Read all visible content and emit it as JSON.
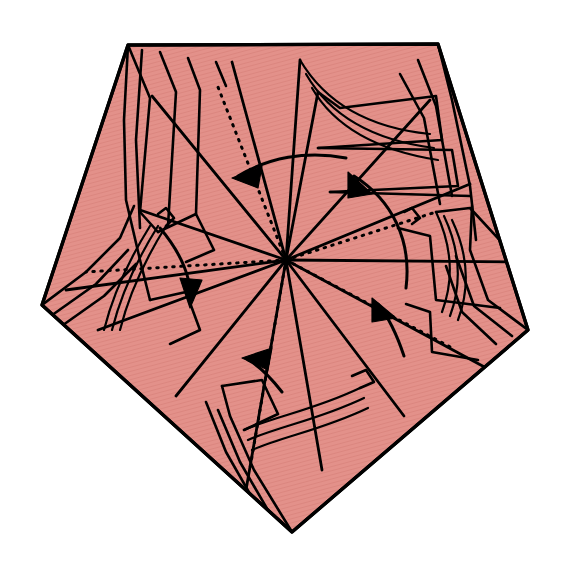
{
  "figure": {
    "canvas": {
      "width": 568,
      "height": 577
    },
    "background_color": "#ffffff"
  },
  "paper": {
    "name": "pentagon-sheet",
    "fill_color": "#E3918A",
    "hatch_color": "#D9837C",
    "stroke_color": "#000000",
    "outline_points": "128,45 438,44 528,330 292,532 42,305",
    "vertices": [
      {
        "label": "top-left",
        "x": 128,
        "y": 45
      },
      {
        "label": "top-right",
        "x": 438,
        "y": 44
      },
      {
        "label": "right",
        "x": 528,
        "y": 330
      },
      {
        "label": "bottom",
        "x": 292,
        "y": 532
      },
      {
        "label": "left",
        "x": 42,
        "y": 305
      }
    ]
  },
  "center": {
    "name": "twist-center",
    "x": 286,
    "y": 260
  },
  "dotted_folds": [
    {
      "name": "dotted-fold-top-left",
      "path": "M286,260 L216,82"
    },
    {
      "name": "dotted-fold-top-right",
      "path": "M286,260 L436,212"
    },
    {
      "name": "dotted-fold-right",
      "path": "M286,260 L452,348"
    },
    {
      "name": "dotted-fold-bottom",
      "path": "M286,260 L250,468"
    },
    {
      "name": "dotted-fold-left",
      "path": "M286,260 L86,272"
    }
  ],
  "radial_creases": [
    {
      "name": "crease-r1",
      "path": "M286,260 L140,210"
    },
    {
      "name": "crease-r2",
      "path": "M286,260 L152,96"
    },
    {
      "name": "crease-r3",
      "path": "M286,260 L232,62"
    },
    {
      "name": "crease-r4",
      "path": "M286,260 L300,60"
    },
    {
      "name": "crease-r5",
      "path": "M286,260 L318,92"
    },
    {
      "name": "crease-r6",
      "path": "M286,260 L430,100"
    },
    {
      "name": "crease-r7",
      "path": "M286,260 L470,184"
    },
    {
      "name": "crease-r8",
      "path": "M286,260 L520,262"
    },
    {
      "name": "crease-r9",
      "path": "M286,260 L490,370"
    },
    {
      "name": "crease-r10",
      "path": "M286,260 L404,416"
    },
    {
      "name": "crease-r11",
      "path": "M286,260 L322,470"
    },
    {
      "name": "crease-r12",
      "path": "M286,260 L246,490"
    },
    {
      "name": "crease-r13",
      "path": "M286,260 L176,396"
    },
    {
      "name": "crease-r14",
      "path": "M286,260 L98,330"
    },
    {
      "name": "crease-r15",
      "path": "M286,260 L66,290"
    }
  ],
  "pleats": [
    {
      "name": "pleat-tl-1",
      "path": "M128,45 L150,98 L140,212 L158,232"
    },
    {
      "name": "pleat-tl-2",
      "path": "M160,52 L176,92 L168,226"
    },
    {
      "name": "pleat-tl-3",
      "path": "M188,58 L200,90 L196,214"
    },
    {
      "name": "pleat-tl-4",
      "path": "M216,62 L226,86"
    },
    {
      "name": "pleat-tl-5",
      "path": "M128,45 L124,120 L126,200 L140,260 L150,300"
    },
    {
      "name": "pleat-tl-6",
      "path": "M142,50 L136,140 L140,228"
    },
    {
      "name": "pleat-top-ridge",
      "path": "M128,45 L438,44"
    },
    {
      "name": "pleat-tr-1",
      "path": "M438,44 L452,100 L470,186 L476,240"
    },
    {
      "name": "pleat-tr-2",
      "path": "M418,60 L436,106 L452,196"
    },
    {
      "name": "pleat-tr-3",
      "path": "M400,74 L424,118 L440,204"
    },
    {
      "name": "pleat-r-1",
      "path": "M528,330 L488,300 L470,250 L472,206"
    },
    {
      "name": "pleat-r-2",
      "path": "M512,336 L474,306 L456,256"
    },
    {
      "name": "pleat-r-3",
      "path": "M496,344 L462,312 L446,266"
    },
    {
      "name": "pleat-l-1",
      "path": "M42,305 L86,272 L120,238 L134,206"
    },
    {
      "name": "pleat-l-2",
      "path": "M48,318 L96,284 L128,250"
    },
    {
      "name": "pleat-l-3",
      "path": "M56,330 L104,296 L136,264"
    },
    {
      "name": "pleat-b-1",
      "path": "M292,532 L254,470 L230,416 L222,386"
    },
    {
      "name": "pleat-b-2",
      "path": "M276,524 L240,462 L218,410"
    },
    {
      "name": "pleat-b-3",
      "path": "M258,508 L226,452 L206,402"
    }
  ],
  "panel_edges": [
    {
      "name": "panel-edge-upper-right-a",
      "path": "M318,92 L340,108 L436,96 L442,140 L318,148"
    },
    {
      "name": "panel-edge-upper-right-b",
      "path": "M318,148 L452,150 L458,186 L330,192"
    },
    {
      "name": "panel-edge-upper-right-c",
      "path": "M330,192 L470,196"
    },
    {
      "name": "panel-edge-mid-right",
      "path": "M436,212 L470,208 L520,262"
    },
    {
      "name": "panel-edge-right-step",
      "path": "M404,212 L412,208 L420,218 L412,224"
    },
    {
      "name": "panel-edge-lower-right-a",
      "path": "M398,228 L430,236 L436,300 L500,308"
    },
    {
      "name": "panel-edge-lower-right-b",
      "path": "M406,304 L430,312 L432,352 L478,360"
    },
    {
      "name": "panel-edge-lower-left-a",
      "path": "M150,300 L186,292 L200,330 L170,344"
    },
    {
      "name": "panel-edge-lower-left-b",
      "path": "M158,232 L196,214 L214,250 L186,262"
    },
    {
      "name": "panel-edge-left-step",
      "path": "M158,214 L166,208 L174,218 L166,226"
    },
    {
      "name": "panel-edge-bottom-a",
      "path": "M222,386 L262,380 L278,414 L244,430"
    },
    {
      "name": "panel-edge-bottom-b",
      "path": "M352,376 L366,370 L374,382 L360,388"
    }
  ],
  "soft_folds": [
    {
      "name": "soft-fold-top-a",
      "path": "M300,60 C326,104 370,128 430,134"
    },
    {
      "name": "soft-fold-top-b",
      "path": "M306,74 C330,116 372,140 434,148"
    },
    {
      "name": "soft-fold-top-c",
      "path": "M312,88 C334,126 374,150 438,160"
    },
    {
      "name": "soft-fold-right-a",
      "path": "M436,212 C452,246 454,280 442,312"
    },
    {
      "name": "soft-fold-right-b",
      "path": "M444,216 C460,250 462,284 450,316"
    },
    {
      "name": "soft-fold-right-c",
      "path": "M452,220 C468,254 470,288 458,320"
    },
    {
      "name": "soft-fold-left-a",
      "path": "M166,226 C146,258 130,290 120,330"
    },
    {
      "name": "soft-fold-left-b",
      "path": "M158,226 C138,258 122,290 112,330"
    },
    {
      "name": "soft-fold-left-c",
      "path": "M150,226 C130,258 114,290 104,330"
    },
    {
      "name": "soft-fold-bottom-a",
      "path": "M244,430 C276,416 314,410 360,388"
    },
    {
      "name": "soft-fold-bottom-b",
      "path": "M248,440 C280,426 318,420 364,398"
    },
    {
      "name": "soft-fold-bottom-c",
      "path": "M252,450 C284,436 322,430 368,408"
    }
  ],
  "rotation_arrows": [
    {
      "name": "rotation-arrow-upper-left",
      "direction": "counter-clockwise",
      "tail_path": "M346,158 C306,150 268,158 238,176",
      "head_points": "232,178 262,166 258,188"
    },
    {
      "name": "rotation-arrow-upper-right",
      "direction": "counter-clockwise",
      "tail_path": "M406,288 C412,240 392,200 354,176",
      "head_points": "348,172 372,194 348,198"
    },
    {
      "name": "rotation-arrow-left",
      "direction": "counter-clockwise",
      "tail_path": "M160,228 C182,254 192,280 190,300",
      "head_points": "190,308 180,278 202,280"
    },
    {
      "name": "rotation-arrow-bottom-left",
      "direction": "counter-clockwise",
      "tail_path": "M282,392 C268,374 256,364 248,360",
      "head_points": "242,358 272,348 268,370"
    },
    {
      "name": "rotation-arrow-bottom-right",
      "direction": "counter-clockwise",
      "tail_path": "M404,356 C396,332 386,314 378,304",
      "head_points": "372,298 396,318 372,322"
    }
  ],
  "legend": {
    "dotted_meaning": "valley / reference fold",
    "solid_meaning": "paper edge or mountain crease",
    "arrow_meaning": "rotate / twist in this direction"
  }
}
